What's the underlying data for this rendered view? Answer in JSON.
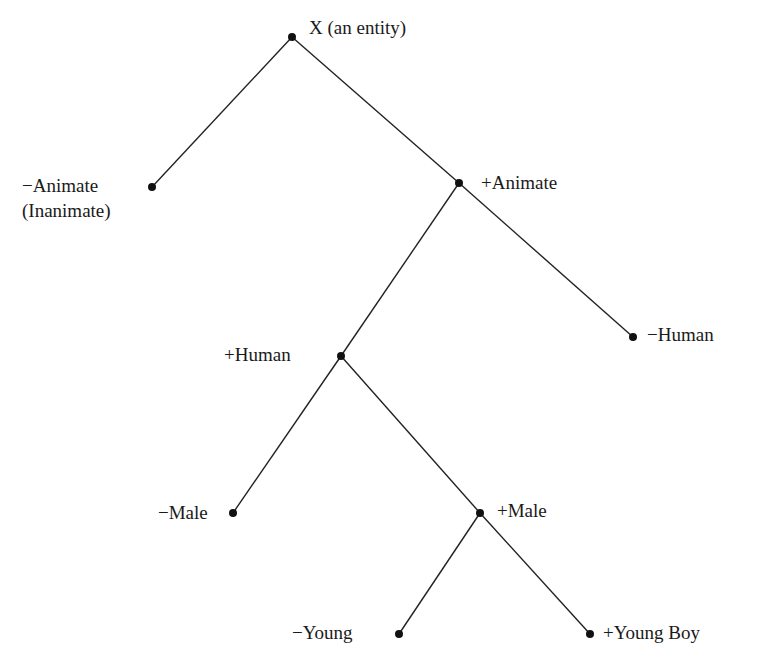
{
  "diagram": {
    "type": "feature-tree",
    "nodes": [
      {
        "id": "root",
        "label": "X (an entity)",
        "x": 292,
        "y": 37
      },
      {
        "id": "neg-animate",
        "label": "−Animate",
        "sublabel": "(Inanimate)",
        "x": 152,
        "y": 187
      },
      {
        "id": "pos-animate",
        "label": "+Animate",
        "x": 459,
        "y": 183
      },
      {
        "id": "neg-human",
        "label": "−Human",
        "x": 633,
        "y": 337
      },
      {
        "id": "pos-human",
        "label": "+Human",
        "x": 341,
        "y": 356
      },
      {
        "id": "neg-male",
        "label": "−Male",
        "x": 233,
        "y": 513
      },
      {
        "id": "pos-male",
        "label": "+Male",
        "x": 480,
        "y": 513
      },
      {
        "id": "neg-young",
        "label": "−Young",
        "x": 399,
        "y": 634
      },
      {
        "id": "pos-young-boy",
        "label": "+Young Boy",
        "x": 590,
        "y": 634
      }
    ],
    "edges": [
      [
        "root",
        "neg-animate"
      ],
      [
        "root",
        "pos-animate"
      ],
      [
        "pos-animate",
        "pos-human"
      ],
      [
        "pos-animate",
        "neg-human"
      ],
      [
        "pos-human",
        "neg-male"
      ],
      [
        "pos-human",
        "pos-male"
      ],
      [
        "pos-male",
        "neg-young"
      ],
      [
        "pos-male",
        "pos-young-boy"
      ]
    ]
  }
}
